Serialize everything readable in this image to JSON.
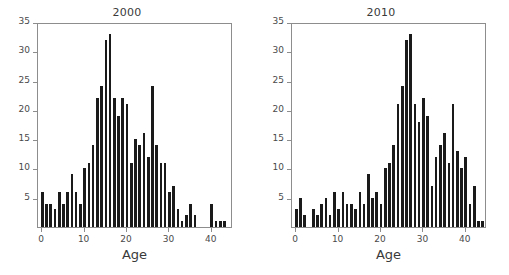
{
  "figure": {
    "background": "#ffffff",
    "bar_color": "#1a1a1a",
    "axis_color": "#8d8d8d",
    "text_color": "#3a3a3a"
  },
  "panels": [
    {
      "key": "panel_2000",
      "title": "2000",
      "xlabel": "Age",
      "ylabel": "",
      "xticks": [
        0,
        10,
        20,
        30,
        40
      ],
      "yticks": [
        5,
        10,
        15,
        20,
        25,
        30,
        35
      ],
      "xlim": [
        -1,
        45
      ],
      "ylim": [
        0,
        35
      ]
    },
    {
      "key": "panel_2010",
      "title": "2010",
      "xlabel": "Age",
      "ylabel": "",
      "xticks": [
        0,
        10,
        20,
        30,
        40
      ],
      "yticks": [
        5,
        10,
        15,
        20,
        25,
        30,
        35
      ],
      "xlim": [
        -1,
        45
      ],
      "ylim": [
        0,
        35
      ]
    }
  ],
  "chart_data": [
    {
      "type": "bar",
      "title": "2000",
      "xlabel": "Age",
      "ylabel": "",
      "xlim": [
        -1,
        45
      ],
      "ylim": [
        0,
        35
      ],
      "grid": false,
      "legend": "none",
      "categories": [
        0,
        1,
        2,
        3,
        4,
        5,
        6,
        7,
        8,
        9,
        10,
        11,
        12,
        13,
        14,
        15,
        16,
        17,
        18,
        19,
        20,
        21,
        22,
        23,
        24,
        25,
        26,
        27,
        28,
        29,
        30,
        31,
        32,
        33,
        34,
        35,
        36,
        37,
        38,
        39,
        40,
        41,
        42,
        43
      ],
      "values": [
        6,
        4,
        4,
        3,
        6,
        4,
        6,
        9,
        6,
        4,
        10,
        11,
        14,
        22,
        24,
        32,
        33,
        22,
        19,
        22,
        21,
        11,
        15,
        14,
        16,
        12,
        24,
        14,
        11,
        11,
        6,
        7,
        3,
        1,
        2,
        4,
        2,
        0,
        0,
        0,
        4,
        1,
        1,
        1
      ]
    },
    {
      "type": "bar",
      "title": "2010",
      "xlabel": "Age",
      "ylabel": "",
      "xlim": [
        -1,
        45
      ],
      "ylim": [
        0,
        35
      ],
      "grid": false,
      "legend": "none",
      "categories": [
        0,
        1,
        2,
        3,
        4,
        5,
        6,
        7,
        8,
        9,
        10,
        11,
        12,
        13,
        14,
        15,
        16,
        17,
        18,
        19,
        20,
        21,
        22,
        23,
        24,
        25,
        26,
        27,
        28,
        29,
        30,
        31,
        32,
        33,
        34,
        35,
        36,
        37,
        38,
        39,
        40,
        41,
        42,
        43,
        44
      ],
      "values": [
        3,
        5,
        2,
        0,
        3,
        2,
        4,
        5,
        2,
        6,
        3,
        6,
        4,
        4,
        3,
        6,
        4,
        9,
        5,
        6,
        4,
        10,
        11,
        14,
        21,
        24,
        32,
        33,
        21,
        18,
        22,
        19,
        7,
        12,
        14,
        16,
        11,
        21,
        13,
        10,
        12,
        4,
        7,
        1,
        1
      ]
    }
  ]
}
